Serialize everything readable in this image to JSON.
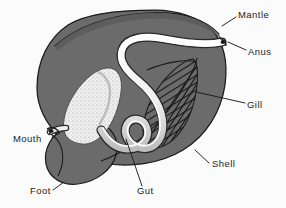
{
  "figure": {
    "background_color": "#fbfbfb",
    "body_color": "#6b6b6b",
    "body_shadow_color": "#555555",
    "organ_color": "#f2f2f2",
    "organ_shade_color": "#cfcfcf",
    "line_color": "#1b1b1b",
    "label_color": "#1b1b1b"
  },
  "labels": [
    {
      "id": "mantle",
      "text": "Mantle",
      "x": 238,
      "y": 15,
      "anchor": "start"
    },
    {
      "id": "anus",
      "text": "Anus",
      "x": 248,
      "y": 53,
      "anchor": "start"
    },
    {
      "id": "gill",
      "text": "Gill",
      "x": 247,
      "y": 106,
      "anchor": "start"
    },
    {
      "id": "shell",
      "text": "Shell",
      "x": 211,
      "y": 166,
      "anchor": "start"
    },
    {
      "id": "mouth",
      "text": "Mouth",
      "x": 14,
      "y": 141,
      "anchor": "start"
    },
    {
      "id": "foot",
      "text": "Foot",
      "x": 31,
      "y": 193,
      "anchor": "start"
    },
    {
      "id": "gut",
      "text": "Gut",
      "x": 137,
      "y": 193,
      "anchor": "start"
    }
  ],
  "leaders": [
    {
      "id": "mantle-leader",
      "d": "M 236 17 L 225 25"
    },
    {
      "id": "anus-leader",
      "d": "M 246 50 L 232 44"
    },
    {
      "id": "gill-leader",
      "d": "M 245 103 L 205 95"
    },
    {
      "id": "shell-leader",
      "d": "M 209 162 L 196 152"
    },
    {
      "id": "mouth-leader",
      "d": "M 52 137 L 62 132"
    },
    {
      "id": "foot-leader",
      "d": "M 53 190 L 63 183"
    },
    {
      "id": "gut-leader",
      "d": "M 142 186 L 128 138"
    }
  ],
  "parts": [
    {
      "id": "shell-body",
      "name": "Shell",
      "description": "Large dark grey shell / body mass occupying the centre of the figure"
    },
    {
      "id": "mantle-fold",
      "name": "Mantle",
      "description": "Thin arching fold along the upper rim of the shell"
    },
    {
      "id": "foot-lobe",
      "name": "Foot",
      "description": "Rounded muscular lobe projecting at the lower left"
    },
    {
      "id": "gill-plate",
      "name": "Gill",
      "description": "Lens-shaped plate with diagonal hatching, right of centre"
    },
    {
      "id": "gut-stomach",
      "name": "Gut",
      "description": "Pale stippled stomach mass with a coiled intestinal loop"
    },
    {
      "id": "intestine",
      "name": "Intestine",
      "description": "Pale tube running from the gut up to the anus"
    },
    {
      "id": "mouth-point",
      "name": "Mouth",
      "description": "Opening at the left margin where the gut meets the body edge"
    },
    {
      "id": "anus-point",
      "name": "Anus",
      "description": "Opening at the upper right where the intestine exits"
    }
  ]
}
